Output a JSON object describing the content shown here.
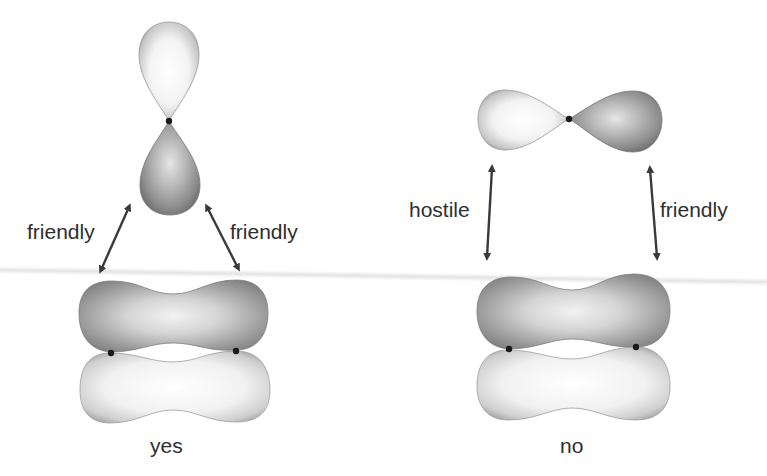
{
  "left_panel": {
    "labels": {
      "left_arrow": "friendly",
      "right_arrow": "friendly"
    },
    "caption": "yes",
    "top_orbital": "p-orbital-vertical",
    "bottom_orbital": "pi-bond-orbital"
  },
  "right_panel": {
    "labels": {
      "left_arrow": "hostile",
      "right_arrow": "friendly"
    },
    "caption": "no",
    "top_orbital": "p-orbital-horizontal",
    "bottom_orbital": "pi-bond-orbital"
  },
  "colors": {
    "light_lobe": "#f2f2f2",
    "dark_lobe": "#8a8a8a",
    "lobe_edge": "#7a7a7a",
    "arrow": "#3a3a3a",
    "text": "#2e2e2e"
  }
}
